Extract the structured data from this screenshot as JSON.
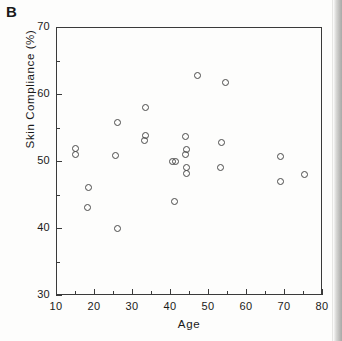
{
  "figure": {
    "panel_label": "B",
    "background_color": "#fdfdfc",
    "frame_color": "#3a3a3a",
    "marker_color": "#4a4a4a"
  },
  "chart_data": {
    "type": "scatter",
    "title": "B",
    "xlabel": "Age",
    "ylabel": "Skin Compliance (%)",
    "xlim": [
      10,
      80
    ],
    "ylim": [
      30,
      70
    ],
    "xticks": [
      10,
      20,
      30,
      40,
      50,
      60,
      70,
      80
    ],
    "yticks": [
      30,
      40,
      50,
      60,
      70
    ],
    "xtick_labels": [
      "10",
      "20",
      "30",
      "40",
      "50",
      "60",
      "70",
      "80"
    ],
    "ytick_labels": [
      "30",
      "40",
      "50",
      "60",
      "70"
    ],
    "x_minor_ticks": [
      15,
      25,
      35,
      45,
      55,
      65,
      75
    ],
    "y_minor_ticks": [
      35,
      45,
      55,
      65
    ],
    "grid": false,
    "legend": null,
    "marker": "open-circle",
    "series": [
      {
        "name": "subjects",
        "points": [
          {
            "x": 15.2,
            "y": 51.8
          },
          {
            "x": 15.2,
            "y": 51.0
          },
          {
            "x": 18.5,
            "y": 46.0
          },
          {
            "x": 18.4,
            "y": 43.0
          },
          {
            "x": 25.6,
            "y": 50.8
          },
          {
            "x": 26.1,
            "y": 55.8
          },
          {
            "x": 26.3,
            "y": 40.0
          },
          {
            "x": 33.5,
            "y": 58.0
          },
          {
            "x": 33.6,
            "y": 53.8
          },
          {
            "x": 33.4,
            "y": 53.0
          },
          {
            "x": 40.6,
            "y": 50.0
          },
          {
            "x": 41.4,
            "y": 49.9
          },
          {
            "x": 41.1,
            "y": 43.9
          },
          {
            "x": 44.2,
            "y": 53.7
          },
          {
            "x": 44.3,
            "y": 51.7
          },
          {
            "x": 44.2,
            "y": 50.9
          },
          {
            "x": 44.3,
            "y": 49.0
          },
          {
            "x": 44.3,
            "y": 48.2
          },
          {
            "x": 47.3,
            "y": 62.7
          },
          {
            "x": 53.5,
            "y": 52.7
          },
          {
            "x": 53.3,
            "y": 49.0
          },
          {
            "x": 54.5,
            "y": 61.7
          },
          {
            "x": 69.2,
            "y": 50.7
          },
          {
            "x": 69.1,
            "y": 47.0
          },
          {
            "x": 75.3,
            "y": 48.0
          }
        ]
      }
    ]
  }
}
